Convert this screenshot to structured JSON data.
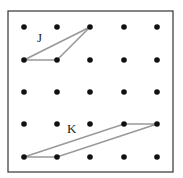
{
  "diagram": {
    "type": "dot-grid-shapes",
    "frame": {
      "x": 8,
      "y": 11,
      "width": 165,
      "height": 161,
      "stroke": "#333333"
    },
    "grid": {
      "columns": [
        24,
        57,
        90,
        124,
        157
      ],
      "rows": [
        27,
        60,
        92,
        124,
        157
      ],
      "dot_radius": 2.8,
      "dot_color": "#111111"
    },
    "shapes": [
      {
        "name": "J",
        "label": "J",
        "label_pos": {
          "x": 37,
          "y": 42
        },
        "stroke": "#999999",
        "vertices_grid": [
          [
            0,
            1
          ],
          [
            1,
            1
          ],
          [
            2,
            0
          ]
        ]
      },
      {
        "name": "K",
        "label": "K",
        "label_pos": {
          "x": 67,
          "y": 133
        },
        "stroke": "#999999",
        "vertices_grid": [
          [
            0,
            4
          ],
          [
            1,
            4
          ],
          [
            4,
            3
          ],
          [
            3,
            3
          ]
        ]
      }
    ]
  }
}
